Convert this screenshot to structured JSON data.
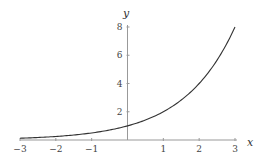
{
  "chart_data": {
    "type": "line",
    "title": "",
    "xlabel": "x",
    "ylabel": "y",
    "xlim": [
      -3,
      3
    ],
    "ylim": [
      0,
      8
    ],
    "grid": false,
    "x_ticks": [
      "-3",
      "-2",
      "-1",
      "1",
      "2",
      "3"
    ],
    "x_tick_values": [
      -3,
      -2,
      -1,
      1,
      2,
      3
    ],
    "y_ticks": [
      "2",
      "4",
      "6",
      "8"
    ],
    "y_tick_values": [
      2,
      4,
      6,
      8
    ],
    "series": [
      {
        "name": "y = 2^x",
        "function": "2^x",
        "x": [
          -3,
          -2.5,
          -2,
          -1.5,
          -1,
          -0.5,
          0,
          0.5,
          1,
          1.5,
          2,
          2.5,
          3
        ],
        "values": [
          0.125,
          0.177,
          0.25,
          0.354,
          0.5,
          0.707,
          1,
          1.414,
          2,
          2.828,
          4,
          5.657,
          8
        ],
        "color": "#333333"
      }
    ],
    "axis_color": "#999999"
  }
}
